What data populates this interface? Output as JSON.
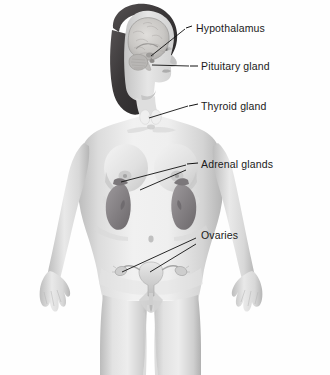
{
  "figure": {
    "view": "anterior",
    "style": "grayscale-airbrush-illustration",
    "background_color": "#fefefe",
    "label_color": "#1a1a1a",
    "leader_line_color": "#111111",
    "skin_tone": "#d8d8d8",
    "hair_color": "#3d3a3a",
    "organ_tone": "#8f8c8e",
    "brain_tone": "#c8c6c4"
  },
  "labels": [
    {
      "id": "hypothalamus",
      "text": "Hypothalamus",
      "x": 196,
      "y": 28,
      "target": "brain-base",
      "leader": "diagonal-down-left",
      "dash": true
    },
    {
      "id": "pituitary",
      "text": "Pituitary gland",
      "x": 203,
      "y": 63,
      "target": "pituitary-gland",
      "leader": "horizontal-left",
      "dash": true
    },
    {
      "id": "thyroid",
      "text": "Thyroid gland",
      "x": 203,
      "y": 104,
      "target": "thyroid-gland",
      "leader": "diagonal-down-left",
      "dash": true
    },
    {
      "id": "adrenal",
      "text": "Adrenal glands",
      "x": 203,
      "y": 163,
      "target": "adrenal-glands",
      "leader": "double-diagonal-down-left",
      "dash": true
    },
    {
      "id": "ovaries",
      "text": "Ovaries",
      "x": 203,
      "y": 233,
      "target": "ovaries",
      "leader": "double-diagonal-down-left",
      "dash": false
    }
  ],
  "organs": [
    {
      "id": "brain",
      "name": "Brain (cerebrum)",
      "region": "head"
    },
    {
      "id": "cerebellum",
      "name": "Cerebellum",
      "region": "head"
    },
    {
      "id": "hypothalamus",
      "name": "Hypothalamus",
      "region": "head"
    },
    {
      "id": "pituitary",
      "name": "Pituitary gland",
      "region": "head"
    },
    {
      "id": "thyroid",
      "name": "Thyroid gland",
      "region": "neck"
    },
    {
      "id": "kidney-left",
      "name": "Kidney (left)",
      "region": "abdomen"
    },
    {
      "id": "kidney-right",
      "name": "Kidney (right)",
      "region": "abdomen"
    },
    {
      "id": "adrenal-left",
      "name": "Adrenal gland (left)",
      "region": "abdomen"
    },
    {
      "id": "adrenal-right",
      "name": "Adrenal gland (right)",
      "region": "abdomen"
    },
    {
      "id": "uterus",
      "name": "Uterus",
      "region": "pelvis"
    },
    {
      "id": "ovary-left",
      "name": "Ovary (left)",
      "region": "pelvis"
    },
    {
      "id": "ovary-right",
      "name": "Ovary (right)",
      "region": "pelvis"
    }
  ]
}
